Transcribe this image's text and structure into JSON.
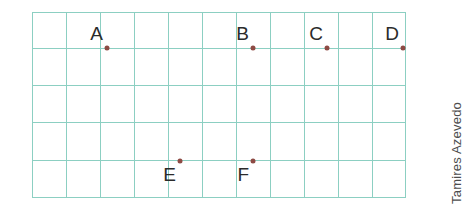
{
  "figure": {
    "grid": {
      "columns": 11,
      "rows": 5,
      "cell_width_px": 34,
      "cell_height_px": 37,
      "origin_x_px": 32,
      "origin_y_px": 12,
      "width_px": 374,
      "height_px": 186,
      "line_color": "#8ccfc2",
      "background_color": "#ffffff"
    },
    "point_color": "#8d4a44",
    "label_color": "#2b2b2b",
    "points": [
      {
        "label": "A",
        "col": 2,
        "row": 1,
        "x_px": 107,
        "y_px": 48,
        "label_x_px": 103,
        "label_y_px": 24
      },
      {
        "label": "B",
        "col": 4,
        "row": 1,
        "x_px": 253,
        "y_px": 48,
        "label_x_px": 249,
        "label_y_px": 24
      },
      {
        "label": "C",
        "col": 6,
        "row": 1,
        "x_px": 327,
        "y_px": 48,
        "label_x_px": 323,
        "label_y_px": 24
      },
      {
        "label": "D",
        "col": 8,
        "row": 1,
        "x_px": 403,
        "y_px": 48,
        "label_x_px": 399,
        "label_y_px": 24
      },
      {
        "label": "E",
        "col": 3,
        "row": 4,
        "x_px": 180,
        "y_px": 161,
        "label_x_px": 176,
        "label_y_px": 165
      },
      {
        "label": "F",
        "col": 5,
        "row": 4,
        "x_px": 253,
        "y_px": 161,
        "label_x_px": 249,
        "label_y_px": 165
      }
    ],
    "vertical_lines_px": [
      0,
      34,
      68,
      102,
      136,
      170,
      204,
      238,
      272,
      306,
      340,
      373
    ],
    "horizontal_lines_px": [
      0,
      36,
      73,
      110,
      148,
      185
    ]
  },
  "watermark": {
    "text": "Tamires Azevedo",
    "color": "#4d4d4d"
  }
}
